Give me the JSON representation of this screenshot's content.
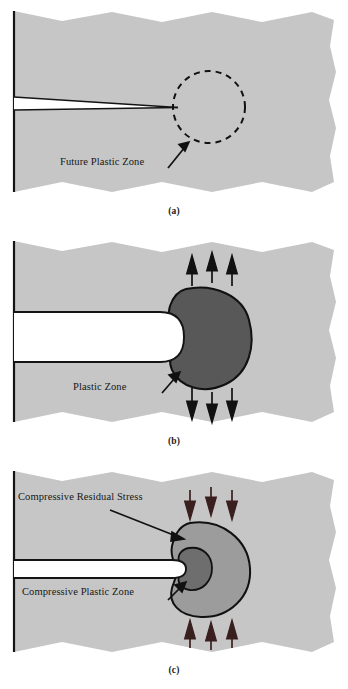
{
  "figure": {
    "type": "technical-diagram",
    "panels": [
      {
        "id": "a",
        "caption": "(a)",
        "stage": "sharp crack before loading",
        "labels": [
          {
            "key": "future_plastic_zone",
            "text": "Future Plastic Zone"
          }
        ],
        "zone": {
          "style": "dashed-outline",
          "fill": "none",
          "stroke": "#111111"
        },
        "crack": {
          "shape": "sharp-wedge",
          "tip": "pointed"
        },
        "arrows": []
      },
      {
        "id": "b",
        "caption": "(b)",
        "stage": "loaded, tensile plastic zone formed",
        "labels": [
          {
            "key": "plastic_zone",
            "text": "Plastic Zone"
          }
        ],
        "zone": {
          "style": "solid-fill",
          "fill": "#585858",
          "stroke": "#111111"
        },
        "crack": {
          "shape": "wide-slot",
          "tip": "blunted-rounded"
        },
        "arrows": {
          "direction": "outward",
          "top_count": 3,
          "bottom_count": 3
        }
      },
      {
        "id": "c",
        "caption": "(c)",
        "stage": "unloaded, compressive residual stress and compressive plastic zone",
        "labels": [
          {
            "key": "compressive_residual_stress",
            "text": "Compressive Residual Stress"
          },
          {
            "key": "compressive_plastic_zone",
            "text": "Compressive Plastic Zone"
          }
        ],
        "zone_outer": {
          "style": "solid-fill",
          "fill": "#9c9c9c",
          "stroke": "#111111"
        },
        "zone_inner": {
          "style": "solid-fill",
          "fill": "#6e6e6e",
          "stroke": "#111111"
        },
        "crack": {
          "shape": "narrow-slot",
          "tip": "slightly-blunted"
        },
        "arrows": {
          "direction": "inward",
          "top_count": 3,
          "bottom_count": 3
        }
      }
    ],
    "colors": {
      "material": "#c6c6c6",
      "material_edge": "#141414",
      "plastic_zone_dark": "#585858",
      "residual_zone_mid": "#9c9c9c",
      "compressive_zone": "#6e6e6e",
      "crack_void": "#ffffff",
      "text": "#171717",
      "background": "#ffffff"
    }
  }
}
